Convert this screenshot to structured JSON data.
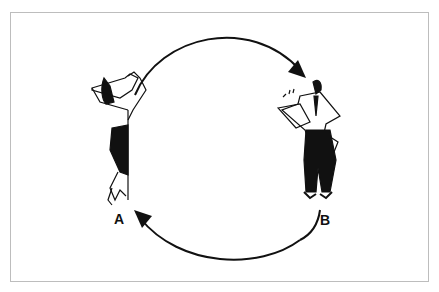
{
  "figure": {
    "labels": {
      "a": "A",
      "b": "B"
    },
    "colors": {
      "ink": "#111111",
      "border": "#bdbdbd",
      "background": "#ffffff"
    }
  }
}
